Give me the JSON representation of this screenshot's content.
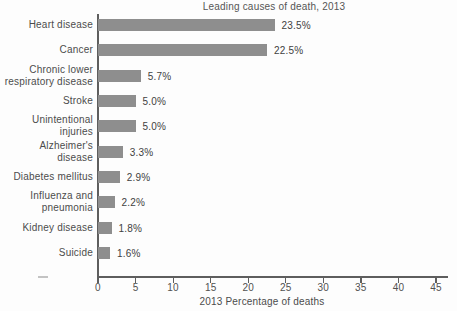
{
  "chart_data": {
    "type": "bar",
    "orientation": "horizontal",
    "title": "Leading causes of death, 2013",
    "xlabel": "2013 Percentage of deaths",
    "categories": [
      "Heart disease",
      "Cancer",
      "Chronic lower\nrespiratory disease",
      "Stroke",
      "Unintentional\ninjuries",
      "Alzheimer's\ndisease",
      "Diabetes mellitus",
      "Influenza and\npneumonia",
      "Kidney disease",
      "Suicide"
    ],
    "values": [
      23.5,
      22.5,
      5.7,
      5.0,
      5.0,
      3.3,
      2.9,
      2.2,
      1.8,
      1.6
    ],
    "value_labels": [
      "23.5%",
      "22.5%",
      "5.7%",
      "5.0%",
      "5.0%",
      "3.3%",
      "2.9%",
      "2.2%",
      "1.8%",
      "1.6%"
    ],
    "xlim": [
      0,
      45
    ],
    "xticks": [
      0,
      5,
      10,
      15,
      20,
      25,
      30,
      35,
      40,
      45
    ],
    "grid": false,
    "legend": null,
    "data_labels_shown": true,
    "colors": {
      "bar": "#8e8e8e",
      "axis": "#5e5e5e",
      "text": "#4c4c4c"
    }
  }
}
